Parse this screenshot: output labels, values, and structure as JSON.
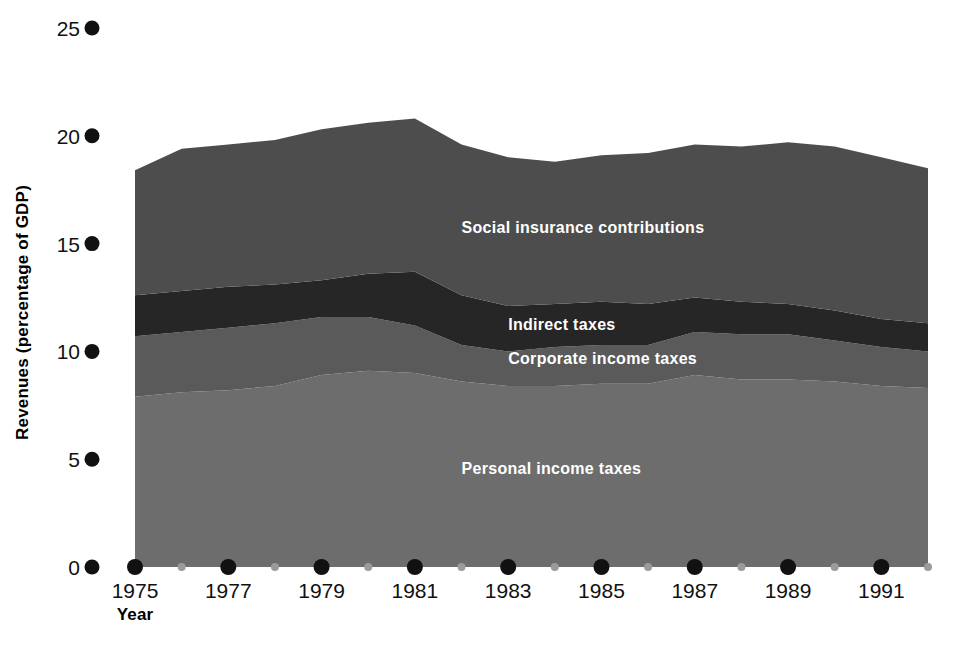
{
  "figure": {
    "background": "#ffffff",
    "width": 956,
    "height": 652
  },
  "axes": {
    "y_title": "Revenues (percentage of GDP)",
    "x_title": "Year",
    "y_ticks": [
      "0",
      "5",
      "10",
      "15",
      "20",
      "25"
    ],
    "x_ticks": [
      "1975",
      "1977",
      "1979",
      "1981",
      "1983",
      "1985",
      "1987",
      "1989",
      "1991"
    ]
  },
  "labels": {
    "social_insurance": "Social insurance contributions",
    "indirect_taxes": "Indirect taxes",
    "corporate_income_taxes": "Corporate income taxes",
    "personal_income_taxes": "Personal income taxes"
  },
  "colors": {
    "personal_income_taxes": "#6d6d6d",
    "corporate_income_taxes": "#5a5a5a",
    "indirect_taxes": "#262626",
    "social_insurance": "#4d4d4d",
    "tick_major": "#111111",
    "tick_minor": "#9b9b9b",
    "text": "#111111",
    "label_text": "#ffffff"
  },
  "chart_data": {
    "type": "area",
    "title": "",
    "xlabel": "Year",
    "ylabel": "Revenues (percentage of GDP)",
    "stacked": true,
    "grid": false,
    "legend_position": "inline-annotations",
    "xlim": [
      1975,
      1992
    ],
    "ylim": [
      0,
      25
    ],
    "ytick_values": [
      0,
      5,
      10,
      15,
      20,
      25
    ],
    "xtick_values": [
      1975,
      1977,
      1979,
      1981,
      1983,
      1985,
      1987,
      1989,
      1991
    ],
    "xtick_minor_values": [
      1976,
      1978,
      1980,
      1982,
      1984,
      1986,
      1988,
      1990,
      1992
    ],
    "x": [
      1975,
      1976,
      1977,
      1978,
      1979,
      1980,
      1981,
      1982,
      1983,
      1984,
      1985,
      1986,
      1987,
      1988,
      1989,
      1990,
      1991,
      1992
    ],
    "series": [
      {
        "name": "Personal income taxes",
        "color": "#6d6d6d",
        "values": [
          7.9,
          8.1,
          8.2,
          8.4,
          8.9,
          9.1,
          9.0,
          8.6,
          8.4,
          8.4,
          8.5,
          8.5,
          8.9,
          8.7,
          8.7,
          8.6,
          8.4,
          8.3
        ]
      },
      {
        "name": "Corporate income taxes",
        "color": "#5a5a5a",
        "values": [
          2.8,
          2.8,
          2.9,
          2.9,
          2.7,
          2.5,
          2.2,
          1.7,
          1.6,
          1.8,
          1.8,
          1.8,
          2.0,
          2.1,
          2.1,
          1.9,
          1.8,
          1.7
        ]
      },
      {
        "name": "Indirect taxes",
        "color": "#262626",
        "values": [
          1.9,
          1.9,
          1.9,
          1.8,
          1.7,
          2.0,
          2.5,
          2.3,
          2.1,
          2.0,
          2.0,
          1.9,
          1.6,
          1.5,
          1.4,
          1.4,
          1.3,
          1.3
        ]
      },
      {
        "name": "Social insurance contributions",
        "color": "#4d4d4d",
        "values": [
          5.8,
          6.6,
          6.6,
          6.7,
          7.0,
          7.0,
          7.1,
          7.0,
          6.9,
          6.6,
          6.8,
          7.0,
          7.1,
          7.2,
          7.5,
          7.6,
          7.5,
          7.2
        ]
      }
    ],
    "series_totals": [
      18.4,
      19.4,
      19.6,
      19.8,
      20.3,
      20.6,
      20.8,
      19.6,
      19.0,
      18.8,
      19.1,
      19.2,
      19.6,
      19.5,
      19.7,
      19.5,
      19.0,
      18.5
    ],
    "annotations": [
      {
        "text": "Social insurance contributions",
        "series": "Social insurance contributions",
        "x": 1982,
        "y": 15.5
      },
      {
        "text": "Indirect taxes",
        "series": "Indirect taxes",
        "x": 1983,
        "y": 11.0
      },
      {
        "text": "Corporate income taxes",
        "series": "Corporate income taxes",
        "x": 1983,
        "y": 9.4
      },
      {
        "text": "Personal income taxes",
        "series": "Personal income taxes",
        "x": 1982,
        "y": 4.3
      }
    ]
  }
}
